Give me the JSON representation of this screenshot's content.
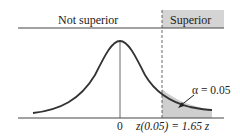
{
  "diagram": {
    "regions": {
      "left_label": "Not superior",
      "right_label": "Superior"
    },
    "annotations": {
      "alpha": "α = 0.05",
      "center_tick": "0",
      "critical_value": "z(0.05) = 1.65",
      "axis_var": "z"
    },
    "colors": {
      "curve": "#333333",
      "shade": "#cccccc",
      "header_box": "#d4d4d4"
    }
  }
}
